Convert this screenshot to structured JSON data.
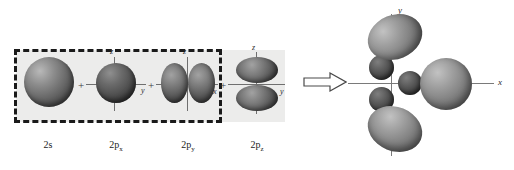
{
  "diagram": {
    "left_panel": {
      "grouping_note": "dashed box encloses 2s, 2px and 2py",
      "orbitals": [
        {
          "label_main": "2p",
          "label_sub": "",
          "label_full": "2s",
          "name": "2s",
          "axes": []
        },
        {
          "label_main": "2p",
          "label_sub": "x",
          "label_full": "2px",
          "name": "2p-x",
          "axes": [
            "z",
            "y"
          ]
        },
        {
          "label_main": "2p",
          "label_sub": "y",
          "label_full": "2py",
          "name": "2p-y",
          "axes": [
            "z",
            "x"
          ]
        },
        {
          "label_main": "2p",
          "label_sub": "z",
          "label_full": "2pz",
          "name": "2p-z",
          "axes": [
            "z",
            "y"
          ]
        }
      ],
      "captions": {
        "s": "2s",
        "px_main": "2p",
        "px_sub": "x",
        "py_main": "2p",
        "py_sub": "y",
        "pz_main": "2p",
        "pz_sub": "z"
      },
      "operators": [
        "+",
        "+",
        "+"
      ],
      "axis_labels": {
        "z1": "z",
        "y1": "y",
        "z2": "z",
        "x2": "x",
        "z3": "z",
        "y3": "y"
      }
    },
    "arrow": {
      "name": "yields-arrow",
      "glyph": "⇒"
    },
    "right_panel": {
      "axis_labels": {
        "vertical": "y",
        "horizontal": "x"
      },
      "description": "three hybrid orbitals, each a large lobe with small back lobe"
    }
  },
  "colors": {
    "background": "#ffffff",
    "band": "#ececeb",
    "dashed_border": "#1a1a1a",
    "axis": "#6f6f6f",
    "text": "#1c1c1c"
  }
}
